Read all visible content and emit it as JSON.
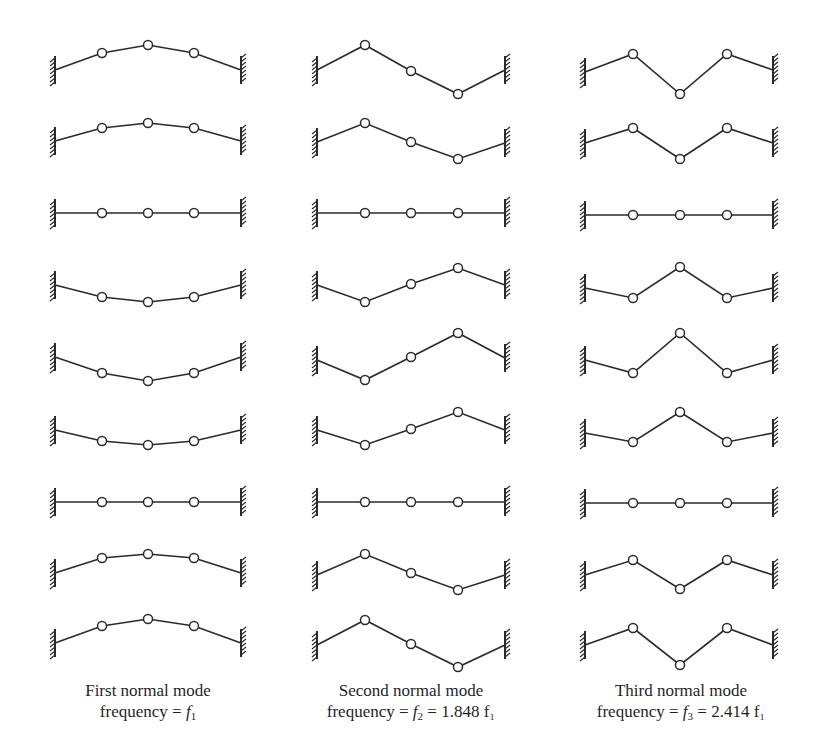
{
  "figure": {
    "stroke_color": "#2a2a2a",
    "background": "#ffffff",
    "mass_radius": 4.5,
    "wall_half_height": 14,
    "columns": [
      {
        "name": "first-mode",
        "left_wall_x": 55,
        "right_wall_x": 241,
        "mass_x": [
          102,
          148,
          194
        ],
        "caption_line1": "First normal mode",
        "caption_line2_prefix": "frequency = ",
        "caption_line2_math": "f",
        "caption_line2_sub": "1",
        "caption_line2_suffix": "",
        "caption_center_x": 148,
        "rows": [
          {
            "wall_left_y": 70,
            "wall_right_y": 70,
            "mass_y": [
              53,
              45,
              53
            ]
          },
          {
            "wall_left_y": 141,
            "wall_right_y": 141,
            "mass_y": [
              128,
              123,
              128
            ]
          },
          {
            "wall_left_y": 213,
            "wall_right_y": 213,
            "mass_y": [
              213,
              213,
              213
            ]
          },
          {
            "wall_left_y": 285,
            "wall_right_y": 285,
            "mass_y": [
              297,
              302,
              297
            ]
          },
          {
            "wall_left_y": 357,
            "wall_right_y": 357,
            "mass_y": [
              373,
              381,
              373
            ]
          },
          {
            "wall_left_y": 430,
            "wall_right_y": 430,
            "mass_y": [
              441,
              445,
              441
            ]
          },
          {
            "wall_left_y": 502,
            "wall_right_y": 502,
            "mass_y": [
              502,
              502,
              502
            ]
          },
          {
            "wall_left_y": 573,
            "wall_right_y": 573,
            "mass_y": [
              558,
              554,
              558
            ]
          },
          {
            "wall_left_y": 643,
            "wall_right_y": 643,
            "mass_y": [
              626,
              619,
              626
            ]
          }
        ]
      },
      {
        "name": "second-mode",
        "left_wall_x": 317,
        "right_wall_x": 505,
        "mass_x": [
          365,
          411,
          458
        ],
        "caption_line1": "Second normal mode",
        "caption_line2_prefix": "frequency = ",
        "caption_line2_math": "f",
        "caption_line2_sub": "2",
        "caption_line2_suffix": " = 1.848 f₁",
        "caption_center_x": 411,
        "rows": [
          {
            "wall_left_y": 70,
            "wall_right_y": 70,
            "mass_y": [
              45,
              71,
              94
            ]
          },
          {
            "wall_left_y": 142,
            "wall_right_y": 143,
            "mass_y": [
              123,
              142,
              159
            ]
          },
          {
            "wall_left_y": 213,
            "wall_right_y": 213,
            "mass_y": [
              213,
              213,
              213
            ]
          },
          {
            "wall_left_y": 285,
            "wall_right_y": 285,
            "mass_y": [
              302,
              284,
              268
            ]
          },
          {
            "wall_left_y": 360,
            "wall_right_y": 358,
            "mass_y": [
              380,
              357,
              333
            ]
          },
          {
            "wall_left_y": 430,
            "wall_right_y": 430,
            "mass_y": [
              445,
              429,
              412
            ]
          },
          {
            "wall_left_y": 502,
            "wall_right_y": 502,
            "mass_y": [
              502,
              502,
              502
            ]
          },
          {
            "wall_left_y": 575,
            "wall_right_y": 575,
            "mass_y": [
              554,
              573,
              590
            ]
          },
          {
            "wall_left_y": 645,
            "wall_right_y": 645,
            "mass_y": [
              620,
              644,
              667
            ]
          }
        ]
      },
      {
        "name": "third-mode",
        "left_wall_x": 585,
        "right_wall_x": 773,
        "mass_x": [
          633,
          680,
          727
        ],
        "caption_line1": "Third normal mode",
        "caption_line2_prefix": "frequency = ",
        "caption_line2_math": "f",
        "caption_line2_sub": "3",
        "caption_line2_suffix": " = 2.414 f₁",
        "caption_center_x": 680,
        "rows": [
          {
            "wall_left_y": 72,
            "wall_right_y": 70,
            "mass_y": [
              54,
              94,
              54
            ]
          },
          {
            "wall_left_y": 143,
            "wall_right_y": 143,
            "mass_y": [
              128,
              159,
              128
            ]
          },
          {
            "wall_left_y": 215,
            "wall_right_y": 215,
            "mass_y": [
              215,
              215,
              215
            ]
          },
          {
            "wall_left_y": 288,
            "wall_right_y": 288,
            "mass_y": [
              298,
              267,
              298
            ]
          },
          {
            "wall_left_y": 360,
            "wall_right_y": 360,
            "mass_y": [
              373,
              333,
              373
            ]
          },
          {
            "wall_left_y": 433,
            "wall_right_y": 433,
            "mass_y": [
              442,
              412,
              442
            ]
          },
          {
            "wall_left_y": 503,
            "wall_right_y": 503,
            "mass_y": [
              503,
              503,
              503
            ]
          },
          {
            "wall_left_y": 575,
            "wall_right_y": 575,
            "mass_y": [
              560,
              589,
              560
            ]
          },
          {
            "wall_left_y": 645,
            "wall_right_y": 645,
            "mass_y": [
              628,
              665,
              628
            ]
          }
        ]
      }
    ]
  }
}
